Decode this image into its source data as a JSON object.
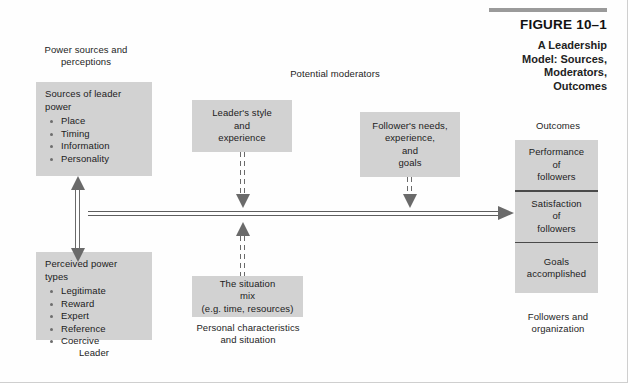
{
  "figure": {
    "number": "FIGURE 10–1",
    "title": "A Leadership\nModel: Sources,\nModerators,\nOutcomes"
  },
  "labels": {
    "power_sources": "Power sources and\nperceptions",
    "potential_moderators": "Potential moderators",
    "outcomes": "Outcomes",
    "leader": "Leader",
    "personal_characteristics": "Personal characteristics\nand situation",
    "followers_org": "Followers and\norganization"
  },
  "boxes": {
    "sources_of_power": {
      "title": "Sources of leader\npower",
      "items": [
        "Place",
        "Timing",
        "Information",
        "Personality"
      ]
    },
    "perceived_power": {
      "title": "Perceived power\ntypes",
      "items": [
        "Legitimate",
        "Reward",
        "Expert",
        "Reference",
        "Coercive"
      ]
    },
    "leader_style": "Leader's style\nand\nexperience",
    "follower_needs": "Follower's needs,\nexperience,\nand\ngoals",
    "situation_mix": "The situation\nmix\n(e.g. time, resources)"
  },
  "outcomes": {
    "items": [
      "Performance\nof\nfollowers",
      "Satisfaction\nof\nfollowers",
      "Goals\naccomplished"
    ]
  },
  "colors": {
    "box_fill": "#d2d2d2",
    "connector": "#6a6a6a",
    "title_rule": "#9a9a9a",
    "text": "#1c1c1c"
  }
}
